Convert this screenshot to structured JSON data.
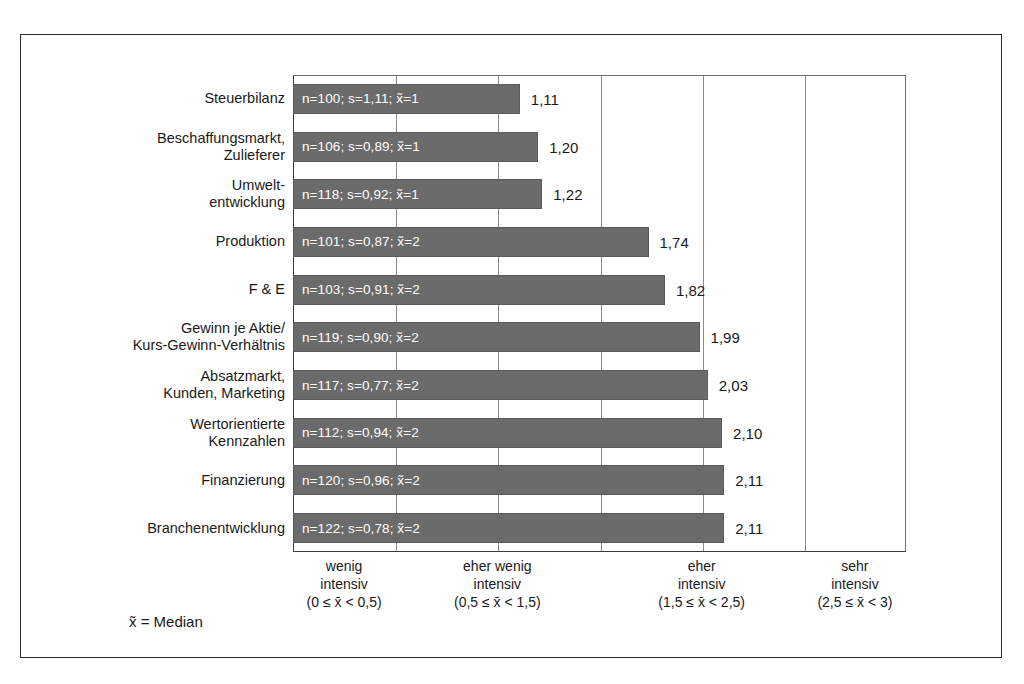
{
  "legend": {
    "median_note": "x̃ = Median"
  },
  "chart_data": {
    "type": "bar",
    "orientation": "horizontal",
    "title": "",
    "xlabel": "",
    "ylabel": "",
    "xlim": [
      0,
      3
    ],
    "grid": true,
    "legend_position": "none",
    "categories": [
      "Steuerbilanz",
      "Beschaffungsmarkt, Zulieferer",
      "Umwelt-entwicklung",
      "Produktion",
      "F & E",
      "Gewinn je Aktie/ Kurs-Gewinn-Verhältnis",
      "Absatzmarkt, Kunden, Marketing",
      "Wertorientierte Kennzahlen",
      "Finanzierung",
      "Branchenentwicklung"
    ],
    "values": [
      1.11,
      1.2,
      1.22,
      1.74,
      1.82,
      1.99,
      2.03,
      2.1,
      2.11,
      2.11
    ],
    "value_labels": [
      "1,11",
      "1,20",
      "1,22",
      "1,74",
      "1,82",
      "1,99",
      "2,03",
      "2,10",
      "2,11",
      "2,11"
    ],
    "bar_color": "#6b6b6b",
    "rows": [
      {
        "label_lines": [
          "Steuerbilanz"
        ],
        "value": 1.11,
        "value_label": "1,11",
        "n": 100,
        "s": "1,11",
        "median": 1,
        "bar_text": "n=100; s=1,11; x̃=1"
      },
      {
        "label_lines": [
          "Beschaffungsmarkt,",
          "Zulieferer"
        ],
        "value": 1.2,
        "value_label": "1,20",
        "n": 106,
        "s": "0,89",
        "median": 1,
        "bar_text": "n=106; s=0,89; x̃=1"
      },
      {
        "label_lines": [
          "Umwelt-",
          "entwicklung"
        ],
        "value": 1.22,
        "value_label": "1,22",
        "n": 118,
        "s": "0,92",
        "median": 1,
        "bar_text": "n=118; s=0,92; x̃=1"
      },
      {
        "label_lines": [
          "Produktion"
        ],
        "value": 1.74,
        "value_label": "1,74",
        "n": 101,
        "s": "0,87",
        "median": 2,
        "bar_text": "n=101; s=0,87; x̃=2"
      },
      {
        "label_lines": [
          "F & E"
        ],
        "value": 1.82,
        "value_label": "1,82",
        "n": 103,
        "s": "0,91",
        "median": 2,
        "bar_text": "n=103; s=0,91; x̃=2"
      },
      {
        "label_lines": [
          "Gewinn je Aktie/",
          "Kurs-Gewinn-Verhältnis"
        ],
        "value": 1.99,
        "value_label": "1,99",
        "n": 119,
        "s": "0,90",
        "median": 2,
        "bar_text": "n=119; s=0,90; x̃=2"
      },
      {
        "label_lines": [
          "Absatzmarkt,",
          "Kunden, Marketing"
        ],
        "value": 2.03,
        "value_label": "2,03",
        "n": 117,
        "s": "0,77",
        "median": 2,
        "bar_text": "n=117; s=0,77; x̃=2"
      },
      {
        "label_lines": [
          "Wertorientierte",
          "Kennzahlen"
        ],
        "value": 2.1,
        "value_label": "2,10",
        "n": 112,
        "s": "0,94",
        "median": 2,
        "bar_text": "n=112; s=0,94; x̃=2"
      },
      {
        "label_lines": [
          "Finanzierung"
        ],
        "value": 2.11,
        "value_label": "2,11",
        "n": 120,
        "s": "0,96",
        "median": 2,
        "bar_text": "n=120; s=0,96; x̃=2"
      },
      {
        "label_lines": [
          "Branchenentwicklung"
        ],
        "value": 2.11,
        "value_label": "2,11",
        "n": 122,
        "s": "0,78",
        "median": 2,
        "bar_text": "n=122; s=0,78; x̃=2"
      }
    ],
    "gridlines": [
      0.5,
      1.0,
      1.5,
      2.0,
      2.5,
      3.0
    ],
    "axis_groups": [
      {
        "line1": "wenig",
        "line2": "intensiv",
        "range": "(0 ≤ x̄ < 0,5)",
        "center": 0.25
      },
      {
        "line1": "eher wenig",
        "line2": "intensiv",
        "range": "(0,5 ≤ x̄ < 1,5)",
        "center": 1.0
      },
      {
        "line1": "eher",
        "line2": "intensiv",
        "range": "(1,5 ≤ x̄ < 2,5)",
        "center": 2.0
      },
      {
        "line1": "sehr",
        "line2": "intensiv",
        "range": "(2,5 ≤ x̄ < 3)",
        "center": 2.75
      }
    ]
  }
}
